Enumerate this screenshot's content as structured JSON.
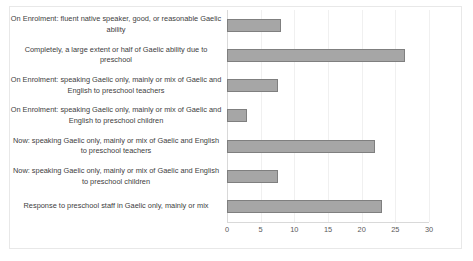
{
  "chart_data": {
    "type": "bar",
    "orientation": "horizontal",
    "title": "",
    "xlabel": "",
    "ylabel": "",
    "xlim": [
      0,
      30
    ],
    "xticks": [
      0,
      5,
      10,
      15,
      20,
      25,
      30
    ],
    "grid": true,
    "legend": false,
    "bar_color": "#a6a6a6",
    "bar_border_color": "#7f7f7f",
    "categories": [
      "On Enrolment: fluent native speaker, good, or reasonable Gaelic ability",
      "Completely, a large extent or half of Gaelic ability due to preschool",
      "On Enrolment: speaking Gaelic only, mainly or mix of Gaelic and English to preschool teachers",
      "On Enrolment: speaking Gaelic only, mainly or mix of Gaelic and English to preschool children",
      "Now: speaking Gaelic only, mainly or mix of Gaelic and English to preschool teachers",
      "Now: speaking Gaelic only, mainly or mix of Gaelic and English to preschool children",
      "Response to preschool staff in Gaelic only, mainly or mix"
    ],
    "values": [
      8,
      26.5,
      7.5,
      3,
      22,
      7.5,
      23
    ]
  }
}
